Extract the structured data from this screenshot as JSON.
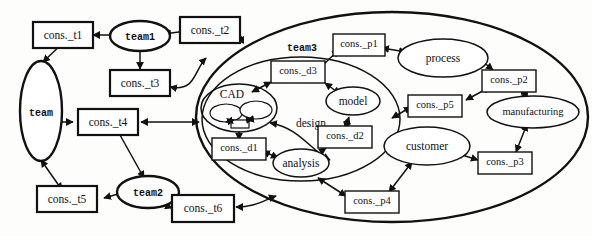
{
  "diagram": {
    "style": {
      "ink": "#111111",
      "paper": "#fdfdfb"
    },
    "containers": [
      {
        "id": "team3",
        "label": "team3",
        "kind": "ellipse"
      },
      {
        "id": "design",
        "label": "design",
        "kind": "ellipse"
      },
      {
        "id": "cad",
        "label": "CAD",
        "kind": "ellipse"
      }
    ],
    "actors": [
      {
        "id": "team",
        "label": "team",
        "kind": "ellipse"
      },
      {
        "id": "team1",
        "label": "team1",
        "kind": "ellipse"
      },
      {
        "id": "team2",
        "label": "team2",
        "kind": "ellipse"
      },
      {
        "id": "process",
        "label": "process",
        "kind": "ellipse"
      },
      {
        "id": "manufacturing",
        "label": "manufacturing",
        "kind": "ellipse"
      },
      {
        "id": "customer",
        "label": "customer",
        "kind": "ellipse"
      },
      {
        "id": "model",
        "label": "model",
        "kind": "ellipse"
      },
      {
        "id": "analysis",
        "label": "analysis",
        "kind": "ellipse"
      },
      {
        "id": "cad_sub_a",
        "label": "",
        "kind": "ellipse"
      },
      {
        "id": "cad_sub_b",
        "label": "",
        "kind": "ellipse"
      }
    ],
    "constraints": [
      {
        "id": "cons_t1",
        "label": "cons._t1"
      },
      {
        "id": "cons_t2",
        "label": "cons._t2"
      },
      {
        "id": "cons_t3",
        "label": "cons._t3"
      },
      {
        "id": "cons_t4",
        "label": "cons._t4"
      },
      {
        "id": "cons_t5",
        "label": "cons._t5"
      },
      {
        "id": "cons_t6",
        "label": "cons._t6"
      },
      {
        "id": "cons_p1",
        "label": "cons._p1"
      },
      {
        "id": "cons_p2",
        "label": "cons._p2"
      },
      {
        "id": "cons_p3",
        "label": "cons._p3"
      },
      {
        "id": "cons_p4",
        "label": "cons._p4"
      },
      {
        "id": "cons_p5",
        "label": "cons._p5"
      },
      {
        "id": "cons_d1",
        "label": "cons._d1"
      },
      {
        "id": "cons_d2",
        "label": "cons._d2"
      },
      {
        "id": "cons_d3",
        "label": "cons._d3"
      },
      {
        "id": "cad_inner_box",
        "label": ""
      }
    ],
    "links": [
      {
        "from": "cons_t1",
        "to": "team1",
        "arrows": "both"
      },
      {
        "from": "team",
        "to": "cons_t1",
        "arrows": "both"
      },
      {
        "from": "team1",
        "to": "cons_t2",
        "arrows": "both"
      },
      {
        "from": "team1",
        "to": "cons_t3",
        "arrows": "to"
      },
      {
        "from": "cons_t2",
        "to": "team3",
        "arrows": "both"
      },
      {
        "from": "cons_t3",
        "to": "team3",
        "arrows": "both"
      },
      {
        "from": "team",
        "to": "cons_t4",
        "arrows": "both"
      },
      {
        "from": "cons_t4",
        "to": "team3",
        "arrows": "both"
      },
      {
        "from": "team",
        "to": "cons_t5",
        "arrows": "both"
      },
      {
        "from": "cons_t5",
        "to": "team2",
        "arrows": "both"
      },
      {
        "from": "team2",
        "to": "cons_t6",
        "arrows": "both"
      },
      {
        "from": "cons_t6",
        "to": "team3",
        "arrows": "both"
      },
      {
        "from": "cons_t4",
        "to": "team2",
        "arrows": "to"
      },
      {
        "from": "cons_p1",
        "to": "process",
        "arrows": "both"
      },
      {
        "from": "cons_p1",
        "to": "design",
        "arrows": "both"
      },
      {
        "from": "process",
        "to": "cons_p2",
        "arrows": "both"
      },
      {
        "from": "cons_p2",
        "to": "manufacturing",
        "arrows": "both"
      },
      {
        "from": "cons_p2",
        "to": "cons_p5",
        "arrows": "both"
      },
      {
        "from": "manufacturing",
        "to": "cons_p3",
        "arrows": "both"
      },
      {
        "from": "cons_p3",
        "to": "customer",
        "arrows": "both"
      },
      {
        "from": "customer",
        "to": "cons_p4",
        "arrows": "both"
      },
      {
        "from": "cons_p4",
        "to": "design",
        "arrows": "both"
      },
      {
        "from": "cons_p5",
        "to": "design",
        "arrows": "both"
      },
      {
        "from": "cad",
        "to": "cons_d3",
        "arrows": "both"
      },
      {
        "from": "cons_d3",
        "to": "model",
        "arrows": "both"
      },
      {
        "from": "model",
        "to": "cons_d2",
        "arrows": "both"
      },
      {
        "from": "cons_d2",
        "to": "analysis",
        "arrows": "both"
      },
      {
        "from": "analysis",
        "to": "cons_d1",
        "arrows": "both"
      },
      {
        "from": "cad",
        "to": "cons_d1",
        "arrows": "to"
      },
      {
        "from": "cad_sub_a",
        "to": "cad_inner_box",
        "arrows": "both"
      },
      {
        "from": "cad_sub_b",
        "to": "cad_inner_box",
        "arrows": "both"
      }
    ]
  }
}
